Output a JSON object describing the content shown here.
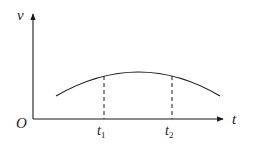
{
  "diagram": {
    "type": "velocity-time graph",
    "y_axis_label": "v",
    "x_axis_label": "t",
    "origin_label": "O",
    "markers": [
      {
        "label": "t",
        "subscript": "1"
      },
      {
        "label": "t",
        "subscript": "2"
      }
    ],
    "curve": "concave-down arc, rising to a maximum between t1 and t2, then falling",
    "colors": {
      "stroke": "#1a1a1a",
      "background": "#ffffff"
    }
  }
}
